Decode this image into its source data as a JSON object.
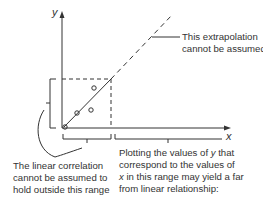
{
  "diagram": {
    "axis_labels": {
      "y": "y",
      "x": "x"
    },
    "annotations": {
      "extrapolation": [
        "This extrapolation",
        "cannot be assumed"
      ],
      "linear_correlation": [
        "The linear correlation",
        "cannot be assumed to",
        "hold outside this range"
      ],
      "plotting": {
        "line1_pre": "Plotting the values of ",
        "line1_var": "y",
        "line1_post": " that",
        "line2": "correspond to the values of",
        "line3_var": "x",
        "line3_post": " in this range may yield a far",
        "line4": "from linear relationship:"
      }
    },
    "points": [
      [
        64,
        128
      ],
      [
        77,
        113
      ],
      [
        94,
        88
      ],
      [
        91,
        110
      ]
    ],
    "colors": {
      "stroke": "#333333",
      "background": "#ffffff"
    }
  }
}
